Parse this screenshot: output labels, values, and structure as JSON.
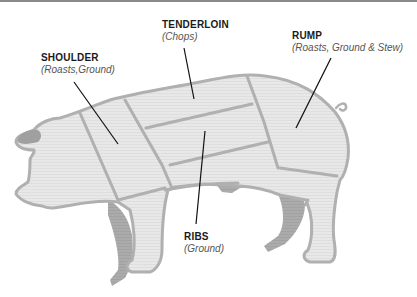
{
  "colors": {
    "body_fill": "#e6e6e6",
    "outline": "#b0b0b0",
    "shadow_legs": "#a8a8a8",
    "leader_line": "#111111",
    "label_text": "#1a1a1a",
    "subtext": "#555555",
    "top_rule": "#8a8a8a"
  },
  "cuts": [
    {
      "id": "shoulder",
      "name": "SHOULDER",
      "uses": "(Roasts,Ground)"
    },
    {
      "id": "tenderloin",
      "name": "TENDERLOIN",
      "uses": "(Chops)"
    },
    {
      "id": "rump",
      "name": "RUMP",
      "uses": "(Roasts, Ground & Stew)"
    },
    {
      "id": "ribs",
      "name": "RIBS",
      "uses": "(Ground)"
    }
  ]
}
